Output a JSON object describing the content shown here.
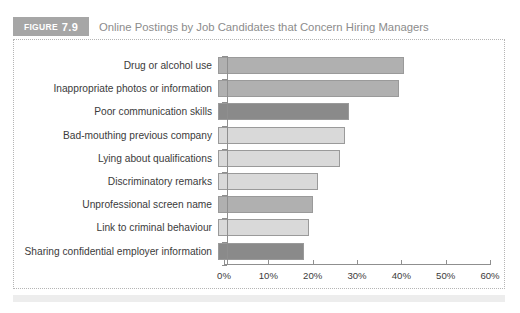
{
  "figure": {
    "tag_word": "FIGURE",
    "tag_number": "7.9",
    "title": "Online Postings by Job Candidates that Concern Hiring Managers"
  },
  "colors": {
    "tag_background": "#a6a6a6",
    "title_text": "#8c8c8c",
    "bar_light": "#d9d9d9",
    "bar_medium": "#b0b0b0",
    "bar_dark": "#8a8a8a",
    "bar_border": "#9a9a9a",
    "axis": "#8f8f8f",
    "frame_dotted": "#b5b5b5",
    "footer_band": "#ededed"
  },
  "chart_data": {
    "type": "bar",
    "orientation": "horizontal",
    "title": "Online Postings by Job Candidates that Concern Hiring Managers",
    "xlabel": "",
    "ylabel": "",
    "xlim": [
      0,
      60
    ],
    "grid": false,
    "legend": "none",
    "tick_labels": [
      "0%",
      "10%",
      "20%",
      "30%",
      "40%",
      "50%",
      "60%"
    ],
    "tick_values": [
      0,
      10,
      20,
      30,
      40,
      50,
      60
    ],
    "categories": [
      "Drug or alcohol use",
      "Inappropriate photos or information",
      "Poor communication skills",
      "Bad-mouthing previous company",
      "Lying about qualifications",
      "Discriminatory remarks",
      "Unprofessional screen name",
      "Link to criminal behaviour",
      "Sharing confidential employer information"
    ],
    "values": [
      41,
      40,
      29,
      28,
      27,
      22,
      21,
      20,
      19
    ],
    "bar_shades": [
      "medium",
      "medium",
      "dark",
      "light",
      "light",
      "light",
      "medium",
      "light",
      "dark"
    ]
  }
}
